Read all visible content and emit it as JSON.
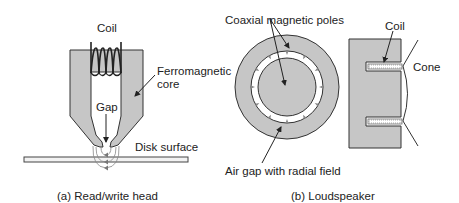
{
  "colors": {
    "fill_gray": "#c6c6c6",
    "stroke": "#333333",
    "text": "#222222",
    "background": "#ffffff"
  },
  "panel_a": {
    "caption": "(a) Read/write head",
    "labels": {
      "coil": "Coil",
      "core_line1": "Ferromagnetic",
      "core_line2": "core",
      "gap": "Gap",
      "disk_surface": "Disk surface"
    }
  },
  "panel_b": {
    "caption": "(b) Loudspeaker",
    "labels": {
      "poles": "Coaxial magnetic poles",
      "air_gap": "Air gap with radial field",
      "coil": "Coil",
      "cone": "Cone"
    }
  }
}
